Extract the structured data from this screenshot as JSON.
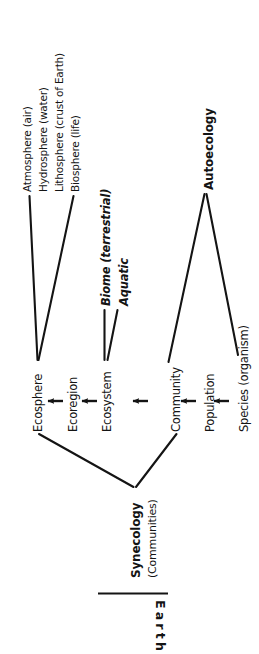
{
  "diagram": {
    "orientation": "rotated-90-ccw",
    "background_color": "#ffffff",
    "ink_color": "#141414"
  },
  "spheres": [
    {
      "id": "atmosphere",
      "label": "Atmosphere (air)"
    },
    {
      "id": "hydrosphere",
      "label": "Hydrosphere (water)"
    },
    {
      "id": "lithosphere",
      "label": "Lithosphere (crust of Earth)"
    },
    {
      "id": "biosphere",
      "label": "Biosphere (life)"
    }
  ],
  "ecosystem_types": [
    {
      "id": "biome",
      "label": "Biome (terrestrial)"
    },
    {
      "id": "aquatic",
      "label": "Aquatic"
    }
  ],
  "chain": [
    {
      "id": "ecosphere",
      "label": "Ecosphere"
    },
    {
      "id": "ecoregion",
      "label": "Ecoregion"
    },
    {
      "id": "ecosystem",
      "label": "Ecosystem"
    },
    {
      "id": "community",
      "label": "Community"
    },
    {
      "id": "population",
      "label": "Population"
    },
    {
      "id": "species",
      "label": "Species (organism)"
    }
  ],
  "arrows": [
    {
      "id": "arrow-ecoregion-to-ecosphere",
      "from": "Ecoregion",
      "to": "Ecosphere"
    },
    {
      "id": "arrow-ecosystem-to-ecoregion",
      "from": "Ecosystem",
      "to": "Ecoregion"
    },
    {
      "id": "arrow-community-to-ecosystem",
      "from": "Community",
      "to": "Ecosystem"
    },
    {
      "id": "arrow-population-to-community",
      "from": "Population",
      "to": "Community"
    },
    {
      "id": "arrow-species-to-population",
      "from": "Species (organism)",
      "to": "Population"
    }
  ],
  "branches": {
    "autoecology": {
      "label": "Autoecology",
      "covers": [
        "Community",
        "Population",
        "Species (organism)"
      ]
    },
    "synecology": {
      "label": "Synecology",
      "sublabel": "(Communities)",
      "covers": [
        "Ecosphere",
        "Ecoregion",
        "Ecosystem",
        "Community"
      ]
    }
  },
  "footer": {
    "earth_label": "Earth"
  }
}
